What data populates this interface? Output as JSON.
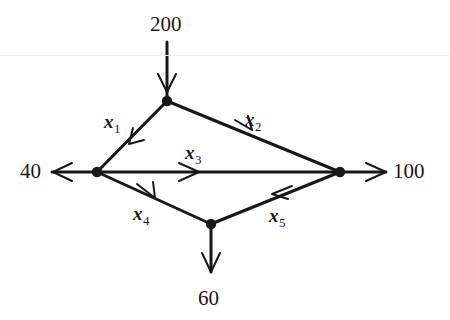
{
  "figure": {
    "background_color": "#ffffff",
    "ink_color": "#18181a"
  },
  "nodes": [
    {
      "id": "n_top",
      "name": "top-node",
      "x": 167,
      "y": 101
    },
    {
      "id": "n_left",
      "name": "left-node",
      "x": 97,
      "y": 172
    },
    {
      "id": "n_right",
      "name": "right-node",
      "x": 340,
      "y": 172
    },
    {
      "id": "n_bottom",
      "name": "bottom-node",
      "x": 211,
      "y": 224
    }
  ],
  "external_flows": [
    {
      "id": "supply_200",
      "label": "200",
      "label_x": 150,
      "label_y": 14,
      "direction": "into-top-node"
    },
    {
      "id": "demand_40",
      "label": "40",
      "label_x": 20,
      "label_y": 161,
      "direction": "out-of-left-node"
    },
    {
      "id": "demand_100",
      "label": "100",
      "label_x": 393,
      "label_y": 161,
      "direction": "out-of-right-node"
    },
    {
      "id": "demand_60",
      "label": "60",
      "label_x": 198,
      "label_y": 288,
      "direction": "out-of-bottom-node"
    }
  ],
  "arc_labels": [
    {
      "id": "x1",
      "base": "x",
      "sub": "1",
      "label_x": 104,
      "label_y": 112,
      "from": "top-node",
      "to": "left-node"
    },
    {
      "id": "x2",
      "base": "x",
      "sub": "2",
      "label_x": 245,
      "label_y": 110,
      "from": "top-node",
      "to": "right-node"
    },
    {
      "id": "x3",
      "base": "x",
      "sub": "3",
      "label_x": 185,
      "label_y": 143,
      "from": "left-node",
      "to": "right-node"
    },
    {
      "id": "x4",
      "base": "x",
      "sub": "4",
      "label_x": 133,
      "label_y": 204,
      "from": "left-node",
      "to": "bottom-node"
    },
    {
      "id": "x5",
      "base": "x",
      "sub": "5",
      "label_x": 269,
      "label_y": 206,
      "from": "right-node",
      "to": "bottom-node"
    }
  ]
}
